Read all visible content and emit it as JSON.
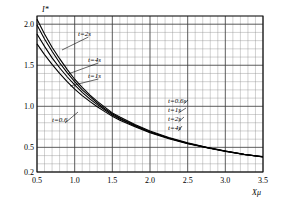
{
  "chart_data": {
    "type": "line",
    "title": "",
    "xlabel": "Xμ",
    "ylabel": "I*",
    "xlim": [
      0.5,
      3.5
    ],
    "ylim": [
      0.2,
      2.1
    ],
    "grid": true,
    "legend_position": "inline-annotations",
    "xticks": [
      "0.5",
      "1.0",
      "1.5",
      "2.0",
      "2.5",
      "3.0",
      "3.5"
    ],
    "xtick_values": [
      0.5,
      1.0,
      1.5,
      2.0,
      2.5,
      3.0,
      3.5
    ],
    "yticks": [
      "0.2",
      "0.5",
      "1.0",
      "1.5",
      "2.0"
    ],
    "ytick_values": [
      0.2,
      0.5,
      1.0,
      1.5,
      2.0
    ],
    "x": [
      0.5,
      0.6,
      0.7,
      0.8,
      0.9,
      1.0,
      1.1,
      1.2,
      1.3,
      1.4,
      1.5,
      1.6,
      1.8,
      2.0,
      2.25,
      2.5,
      2.75,
      3.0,
      3.25,
      3.5
    ],
    "series": [
      {
        "name": "t=0.6s",
        "label": "t=0.6",
        "values": [
          2.06,
          1.88,
          1.72,
          1.58,
          1.45,
          1.33,
          1.23,
          1.14,
          1.06,
          0.99,
          0.92,
          0.87,
          0.78,
          0.7,
          0.62,
          0.555,
          0.5,
          0.455,
          0.415,
          0.385
        ]
      },
      {
        "name": "t=1s",
        "label": "t=1s",
        "values": [
          1.99,
          1.82,
          1.67,
          1.53,
          1.41,
          1.3,
          1.2,
          1.12,
          1.04,
          0.97,
          0.91,
          0.855,
          0.77,
          0.69,
          0.615,
          0.55,
          0.5,
          0.455,
          0.415,
          0.385
        ]
      },
      {
        "name": "t=2s",
        "label": "t=2s",
        "values": [
          1.88,
          1.73,
          1.59,
          1.47,
          1.36,
          1.26,
          1.17,
          1.09,
          1.02,
          0.955,
          0.895,
          0.845,
          0.76,
          0.685,
          0.61,
          0.548,
          0.498,
          0.453,
          0.414,
          0.384
        ]
      },
      {
        "name": "t=4s",
        "label": "t=4s",
        "values": [
          1.76,
          1.63,
          1.51,
          1.4,
          1.3,
          1.21,
          1.13,
          1.06,
          0.995,
          0.935,
          0.88,
          0.83,
          0.75,
          0.678,
          0.605,
          0.545,
          0.496,
          0.451,
          0.413,
          0.383
        ]
      }
    ],
    "annotations_left": [
      {
        "text": "t=2s"
      },
      {
        "text": "t=4s"
      },
      {
        "text": "t=1s"
      },
      {
        "text": "t=0.6"
      }
    ],
    "annotations_right": [
      {
        "text": "t=0.6s"
      },
      {
        "text": "t=1s"
      },
      {
        "text": "t=2s"
      },
      {
        "text": "t=4s"
      }
    ]
  }
}
